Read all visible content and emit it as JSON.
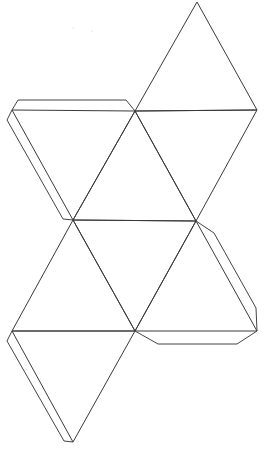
{
  "diagram": {
    "background": "#ffffff",
    "stroke_color": "#3a3a3a",
    "vertices": {
      "top": [
        197,
        2
      ],
      "r1": [
        257,
        110
      ],
      "m1": [
        135,
        111
      ],
      "l1": [
        12,
        110
      ],
      "m2": [
        73,
        220
      ],
      "r2": [
        196,
        221
      ],
      "r3": [
        257,
        331
      ],
      "m3": [
        135,
        331
      ],
      "l3": [
        12,
        331
      ],
      "bottom": [
        73,
        442
      ]
    },
    "faces": [
      {
        "name": "face-1",
        "points": "197,2 257,110 135,111"
      },
      {
        "name": "face-2",
        "points": "135,111 257,110 196,221"
      },
      {
        "name": "face-3",
        "points": "12,110 135,111 73,220"
      },
      {
        "name": "face-4",
        "points": "135,111 196,221 73,220"
      },
      {
        "name": "face-5",
        "points": "73,220 196,221 135,331"
      },
      {
        "name": "face-6",
        "points": "196,221 257,331 135,331"
      },
      {
        "name": "face-7",
        "points": "73,220 135,331 12,331"
      },
      {
        "name": "face-8",
        "points": "12,331 135,331 73,442"
      }
    ],
    "tabs": [
      {
        "name": "tab-top-left",
        "points": "12,110 18,100 126,100 135,111"
      },
      {
        "name": "tab-left-upper",
        "points": "12,110 7,120 63,219 73,220"
      },
      {
        "name": "tab-right-middle",
        "points": "196,221 214,233 256,308 257,331"
      },
      {
        "name": "tab-bottom-right",
        "points": "257,331 237,344 158,344 135,331"
      },
      {
        "name": "tab-left-lower",
        "points": "12,331 7,341 64,441 73,442"
      }
    ]
  }
}
